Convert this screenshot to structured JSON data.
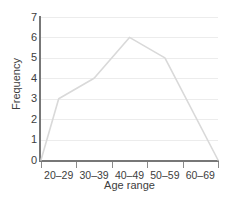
{
  "chart_data": {
    "type": "line",
    "title": "",
    "subtitle": "",
    "xlabel": "Age range",
    "ylabel": "Frequency",
    "categories": [
      "20–29",
      "30–39",
      "40–49",
      "50–59",
      "60–69"
    ],
    "values": [
      3,
      4,
      6,
      5,
      0
    ],
    "series": [
      {
        "name": "Frequency",
        "values": [
          3,
          4,
          6,
          5,
          0
        ]
      }
    ],
    "polygon_points": [
      {
        "x": 0,
        "y": 0,
        "label": "left baseline"
      },
      {
        "x": 0.5,
        "y": 3,
        "label": "20–29"
      },
      {
        "x": 1.5,
        "y": 4,
        "label": "30–39"
      },
      {
        "x": 2.5,
        "y": 6,
        "label": "40–49"
      },
      {
        "x": 3.5,
        "y": 5,
        "label": "50–59"
      },
      {
        "x": 5,
        "y": 0,
        "label": "right baseline"
      }
    ],
    "ylim": [
      0,
      7
    ],
    "xlim": [
      0,
      5
    ],
    "y_ticks": [
      0,
      1,
      2,
      3,
      4,
      5,
      6,
      7
    ],
    "y_tick_labels": [
      "0",
      "1",
      "2",
      "3",
      "4",
      "5",
      "6",
      "7"
    ],
    "grid": true,
    "grid_axis": "y",
    "legend": false,
    "legend_position": "none",
    "annotations": [],
    "colors": {
      "series_line": "#d9d9d9",
      "gridline": "#ececec",
      "axis": "#777777",
      "tick": "#8a8a8a",
      "text": "#3d3d3d",
      "background": "#ffffff"
    }
  }
}
